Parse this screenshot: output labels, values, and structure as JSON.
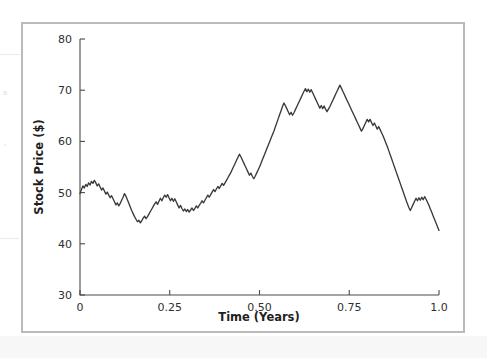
{
  "figure": {
    "frame_color": "#b9babd",
    "background_color": "#ffffff"
  },
  "scan_artifacts": {
    "glyphs": [
      "s",
      "'"
    ],
    "note": ""
  },
  "chart_data": {
    "type": "line",
    "title": "",
    "xlabel": "Time (Years)",
    "ylabel": "Stock Price ($)",
    "xlim": [
      0,
      1.0
    ],
    "ylim": [
      30,
      80
    ],
    "xticks": [
      0,
      0.25,
      0.5,
      0.75,
      1.0
    ],
    "xtick_labels": [
      "0",
      "0.25",
      "0.50",
      "0.75",
      "1.0"
    ],
    "yticks": [
      30,
      40,
      50,
      60,
      70,
      80
    ],
    "ytick_labels": [
      "30",
      "40",
      "50",
      "60",
      "70",
      "80"
    ],
    "grid": false,
    "legend": null,
    "series": [
      {
        "name": "Stock Price",
        "color": "#3a3a3c",
        "x": [
          0.0,
          0.004,
          0.008,
          0.012,
          0.016,
          0.02,
          0.024,
          0.028,
          0.032,
          0.036,
          0.04,
          0.044,
          0.048,
          0.052,
          0.056,
          0.06,
          0.064,
          0.068,
          0.072,
          0.076,
          0.08,
          0.084,
          0.088,
          0.092,
          0.096,
          0.1,
          0.104,
          0.108,
          0.112,
          0.116,
          0.12,
          0.124,
          0.128,
          0.132,
          0.136,
          0.14,
          0.144,
          0.148,
          0.152,
          0.156,
          0.16,
          0.164,
          0.168,
          0.172,
          0.176,
          0.18,
          0.184,
          0.188,
          0.192,
          0.196,
          0.2,
          0.204,
          0.208,
          0.212,
          0.216,
          0.22,
          0.224,
          0.228,
          0.232,
          0.236,
          0.24,
          0.244,
          0.248,
          0.252,
          0.256,
          0.26,
          0.264,
          0.268,
          0.272,
          0.276,
          0.28,
          0.284,
          0.288,
          0.292,
          0.296,
          0.3,
          0.304,
          0.308,
          0.312,
          0.316,
          0.32,
          0.324,
          0.328,
          0.332,
          0.336,
          0.34,
          0.344,
          0.348,
          0.352,
          0.356,
          0.36,
          0.364,
          0.368,
          0.372,
          0.376,
          0.38,
          0.384,
          0.388,
          0.392,
          0.396,
          0.4,
          0.404,
          0.408,
          0.412,
          0.416,
          0.42,
          0.424,
          0.428,
          0.432,
          0.436,
          0.44,
          0.444,
          0.448,
          0.452,
          0.456,
          0.46,
          0.464,
          0.468,
          0.472,
          0.476,
          0.48,
          0.484,
          0.488,
          0.492,
          0.496,
          0.5,
          0.504,
          0.508,
          0.512,
          0.516,
          0.52,
          0.524,
          0.528,
          0.532,
          0.536,
          0.54,
          0.544,
          0.548,
          0.552,
          0.556,
          0.56,
          0.564,
          0.568,
          0.572,
          0.576,
          0.58,
          0.584,
          0.588,
          0.592,
          0.596,
          0.6,
          0.604,
          0.608,
          0.612,
          0.616,
          0.62,
          0.624,
          0.628,
          0.632,
          0.636,
          0.64,
          0.644,
          0.648,
          0.652,
          0.656,
          0.66,
          0.664,
          0.668,
          0.672,
          0.676,
          0.68,
          0.684,
          0.688,
          0.692,
          0.696,
          0.7,
          0.704,
          0.708,
          0.712,
          0.716,
          0.72,
          0.724,
          0.728,
          0.732,
          0.736,
          0.74,
          0.744,
          0.748,
          0.752,
          0.756,
          0.76,
          0.764,
          0.768,
          0.772,
          0.776,
          0.78,
          0.784,
          0.788,
          0.792,
          0.796,
          0.8,
          0.804,
          0.808,
          0.812,
          0.816,
          0.82,
          0.824,
          0.828,
          0.832,
          0.836,
          0.84,
          0.844,
          0.848,
          0.852,
          0.856,
          0.86,
          0.864,
          0.868,
          0.872,
          0.876,
          0.88,
          0.884,
          0.888,
          0.892,
          0.896,
          0.9,
          0.904,
          0.908,
          0.912,
          0.916,
          0.92,
          0.924,
          0.928,
          0.932,
          0.936,
          0.94,
          0.944,
          0.948,
          0.952,
          0.956,
          0.96,
          0.964,
          0.968,
          0.972,
          0.976,
          0.98,
          0.984,
          0.988,
          0.992,
          0.996,
          1.0
        ],
        "y": [
          49.8,
          50.6,
          51.3,
          50.9,
          51.6,
          51.2,
          51.9,
          51.5,
          52.2,
          51.8,
          52.4,
          51.9,
          51.3,
          51.7,
          51.1,
          50.5,
          50.9,
          50.3,
          49.7,
          50.1,
          49.5,
          49.0,
          49.4,
          48.8,
          48.2,
          47.6,
          48.0,
          47.4,
          47.9,
          48.5,
          49.1,
          49.8,
          49.3,
          48.6,
          47.9,
          47.2,
          46.5,
          45.9,
          45.3,
          44.8,
          44.3,
          44.6,
          44.1,
          44.5,
          45.0,
          45.4,
          44.9,
          45.3,
          45.8,
          46.3,
          46.8,
          47.3,
          47.8,
          48.2,
          47.7,
          48.3,
          48.9,
          48.4,
          49.0,
          49.5,
          49.1,
          49.6,
          49.0,
          48.4,
          48.9,
          48.3,
          48.8,
          48.2,
          47.6,
          47.0,
          47.5,
          46.9,
          46.4,
          46.8,
          46.3,
          46.7,
          46.2,
          46.6,
          47.0,
          46.5,
          46.9,
          47.4,
          47.0,
          47.5,
          47.9,
          48.4,
          48.0,
          48.5,
          49.0,
          49.5,
          49.1,
          49.6,
          50.1,
          50.6,
          50.2,
          50.7,
          51.2,
          50.8,
          51.3,
          51.8,
          51.4,
          51.9,
          52.4,
          52.9,
          53.4,
          53.9,
          54.5,
          55.1,
          55.7,
          56.3,
          56.9,
          57.5,
          57.0,
          56.4,
          55.8,
          55.2,
          54.6,
          54.0,
          53.4,
          53.8,
          53.2,
          52.7,
          53.2,
          53.8,
          54.4,
          55.0,
          55.7,
          56.4,
          57.1,
          57.8,
          58.5,
          59.2,
          59.9,
          60.6,
          61.3,
          62.0,
          62.8,
          63.6,
          64.4,
          65.2,
          66.0,
          66.8,
          67.5,
          67.0,
          66.4,
          65.8,
          65.2,
          65.7,
          65.1,
          65.6,
          66.2,
          66.8,
          67.4,
          68.0,
          68.6,
          69.2,
          69.8,
          70.3,
          69.7,
          70.2,
          69.6,
          70.1,
          69.5,
          68.9,
          68.3,
          67.7,
          67.1,
          66.5,
          67.0,
          66.4,
          66.9,
          66.3,
          65.8,
          66.3,
          66.8,
          67.4,
          68.0,
          68.6,
          69.2,
          69.8,
          70.4,
          71.0,
          70.4,
          69.8,
          69.2,
          68.6,
          68.0,
          67.4,
          66.8,
          66.2,
          65.6,
          65.0,
          64.4,
          63.8,
          63.2,
          62.6,
          62.0,
          62.5,
          63.1,
          63.7,
          64.3,
          63.8,
          64.3,
          63.7,
          63.1,
          63.6,
          63.0,
          62.4,
          62.9,
          62.3,
          61.7,
          61.1,
          60.4,
          59.7,
          59.0,
          58.2,
          57.4,
          56.6,
          55.8,
          55.0,
          54.2,
          53.4,
          52.6,
          51.8,
          51.0,
          50.2,
          49.4,
          48.6,
          47.8,
          47.1,
          46.5,
          47.1,
          47.7,
          48.3,
          48.9,
          48.4,
          49.0,
          48.5,
          49.1,
          48.6,
          49.2,
          48.7,
          48.1,
          47.5,
          46.8,
          46.1,
          45.4,
          44.7,
          44.0,
          43.3,
          42.6
        ]
      }
    ]
  }
}
